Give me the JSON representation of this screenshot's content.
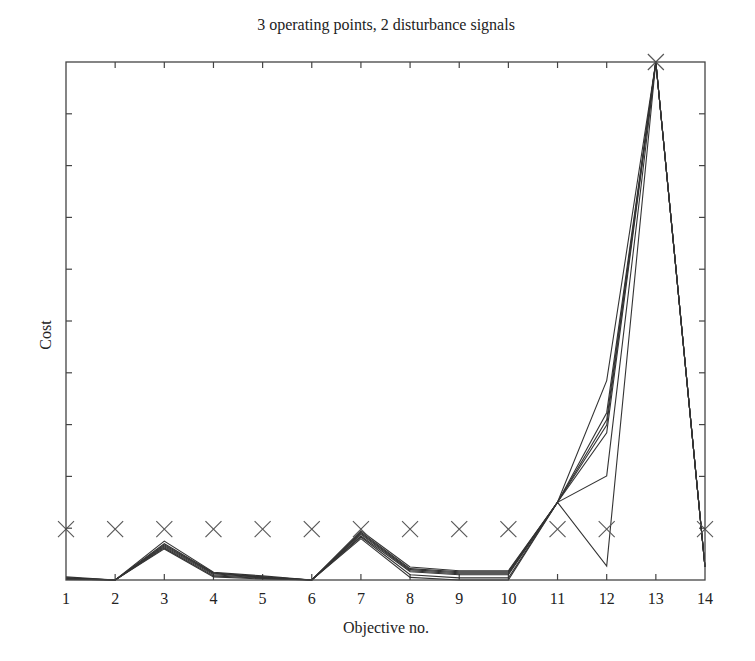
{
  "chart_data": {
    "type": "line",
    "title": "3 operating points, 2 disturbance signals",
    "xlabel": "Objective no.",
    "ylabel": "Cost",
    "x": [
      1,
      2,
      3,
      4,
      5,
      6,
      7,
      8,
      9,
      10,
      11,
      12,
      13,
      14
    ],
    "xlim": [
      1,
      14
    ],
    "ylim": [
      0,
      1
    ],
    "y_ticks_count": 10,
    "y_tick_labels_shown": false,
    "grid": false,
    "legend": null,
    "note": "Cost axis is unlabeled; values are normalized to the plot height (0 = bottom, 1 = top).",
    "series": [
      {
        "name": "line 1",
        "values": [
          0.006,
          0.0,
          0.075,
          0.015,
          0.008,
          0.0,
          0.095,
          0.025,
          0.018,
          0.018,
          0.15,
          0.385,
          1.0,
          0.025
        ]
      },
      {
        "name": "line 2",
        "values": [
          0.004,
          0.0,
          0.07,
          0.014,
          0.006,
          0.0,
          0.092,
          0.022,
          0.016,
          0.016,
          0.15,
          0.323,
          1.0,
          0.025
        ]
      },
      {
        "name": "line 3",
        "values": [
          0.004,
          0.0,
          0.068,
          0.013,
          0.006,
          0.0,
          0.09,
          0.02,
          0.014,
          0.014,
          0.15,
          0.309,
          1.0,
          0.025
        ]
      },
      {
        "name": "line 4",
        "values": [
          0.003,
          0.0,
          0.066,
          0.012,
          0.005,
          0.0,
          0.088,
          0.018,
          0.012,
          0.012,
          0.15,
          0.299,
          1.0,
          0.025
        ]
      },
      {
        "name": "line 5",
        "values": [
          0.002,
          0.0,
          0.064,
          0.01,
          0.004,
          0.0,
          0.085,
          0.016,
          0.01,
          0.01,
          0.15,
          0.284,
          1.0,
          0.025
        ]
      },
      {
        "name": "line 6",
        "values": [
          0.002,
          0.0,
          0.062,
          0.008,
          0.003,
          0.0,
          0.083,
          0.01,
          0.004,
          0.004,
          0.15,
          0.201,
          1.0,
          0.025
        ]
      },
      {
        "name": "line 7",
        "values": [
          0.001,
          0.0,
          0.06,
          0.006,
          0.002,
          0.0,
          0.08,
          0.005,
          0.0,
          0.0,
          0.15,
          0.027,
          1.0,
          0.025
        ]
      }
    ],
    "markers": {
      "symbol": "x",
      "name": "reference",
      "values": [
        0.098,
        0.098,
        0.098,
        0.098,
        0.098,
        0.098,
        0.098,
        0.098,
        0.098,
        0.098,
        0.098,
        0.098,
        1.0,
        0.098
      ]
    }
  },
  "layout": {
    "plot_left": 66,
    "plot_right": 705,
    "plot_top": 62,
    "plot_bottom": 580,
    "line_color": "#333333",
    "frame_color": "#444444",
    "marker_color": "#555555"
  }
}
